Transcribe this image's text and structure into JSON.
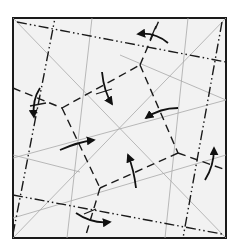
{
  "diagram": {
    "type": "origami crease pattern",
    "paper": {
      "x": 13,
      "y": 18,
      "width": 213,
      "height": 220,
      "fill": "#f2f2f2",
      "border": "#1a1a1a"
    },
    "colors": {
      "reference_line": "#a8a8a8",
      "crease": "#1a1a1a",
      "arrow": "#111111"
    },
    "reference_lines": [
      {
        "id": "diag-tl-br",
        "x1": 13,
        "y1": 18,
        "x2": 226,
        "y2": 238
      },
      {
        "id": "diag-bl-tr",
        "x1": 13,
        "y1": 238,
        "x2": 226,
        "y2": 18
      },
      {
        "id": "steep-left",
        "x1": 92,
        "y1": 18,
        "x2": 67,
        "y2": 238
      },
      {
        "id": "steep-right",
        "x1": 165,
        "y1": 238,
        "x2": 188,
        "y2": 18
      },
      {
        "id": "shallow-upper",
        "x1": 13,
        "y1": 158,
        "x2": 226,
        "y2": 100
      },
      {
        "id": "shallow-lower",
        "x1": 13,
        "y1": 218,
        "x2": 226,
        "y2": 155
      },
      {
        "id": "shallow-top",
        "x1": 120,
        "y1": 55,
        "x2": 226,
        "y2": 100
      },
      {
        "id": "shallow-left",
        "x1": 13,
        "y1": 155,
        "x2": 80,
        "y2": 172
      }
    ],
    "mountain_folds": [
      {
        "id": "top-chain",
        "x1": 17,
        "y1": 22,
        "x2": 226,
        "y2": 62
      },
      {
        "id": "left-chain",
        "x1": 13,
        "y1": 234,
        "x2": 55,
        "y2": 18
      },
      {
        "id": "right-chain",
        "x1": 222,
        "y1": 22,
        "x2": 183,
        "y2": 238
      },
      {
        "id": "bottom-chain",
        "x1": 13,
        "y1": 195,
        "x2": 222,
        "y2": 234
      }
    ],
    "valley_folds": [
      {
        "id": "v-left-upper",
        "x1": 13,
        "y1": 88,
        "x2": 62,
        "y2": 108
      },
      {
        "id": "v-top-mid",
        "x1": 62,
        "y1": 108,
        "x2": 140,
        "y2": 65
      },
      {
        "id": "v-top-right",
        "x1": 140,
        "y1": 65,
        "x2": 160,
        "y2": 18
      },
      {
        "id": "v-right-upper",
        "x1": 140,
        "y1": 65,
        "x2": 178,
        "y2": 153
      },
      {
        "id": "v-right-mid",
        "x1": 178,
        "y1": 153,
        "x2": 226,
        "y2": 170
      },
      {
        "id": "v-bottom-mid",
        "x1": 178,
        "y1": 153,
        "x2": 100,
        "y2": 188
      },
      {
        "id": "v-bottom",
        "x1": 100,
        "y1": 188,
        "x2": 85,
        "y2": 238
      },
      {
        "id": "v-left-lower",
        "x1": 62,
        "y1": 108,
        "x2": 100,
        "y2": 188
      }
    ],
    "arrows": [
      {
        "id": "arrow-top",
        "path": "M 168 43 Q 155 32 138 34",
        "head": [
          138,
          34
        ],
        "dir": "left"
      },
      {
        "id": "arrow-left-down",
        "path": "M 40 88 Q 32 100 34 117",
        "head": [
          34,
          117
        ],
        "dir": "down"
      },
      {
        "id": "arrow-center-down",
        "path": "M 102 72 Q 104 92 112 104",
        "head": [
          112,
          104
        ],
        "dir": "down"
      },
      {
        "id": "arrow-right-center",
        "path": "M 178 108 Q 160 108 146 118",
        "head": [
          146,
          118
        ],
        "dir": "left"
      },
      {
        "id": "arrow-center-right",
        "path": "M 60 150 Q 78 142 94 140",
        "head": [
          94,
          140
        ],
        "dir": "right"
      },
      {
        "id": "arrow-center-up",
        "path": "M 136 188 Q 134 170 128 155",
        "head": [
          128,
          155
        ],
        "dir": "up"
      },
      {
        "id": "arrow-right-up",
        "path": "M 205 180 Q 214 166 214 148",
        "head": [
          214,
          148
        ],
        "dir": "up"
      },
      {
        "id": "arrow-bottom",
        "path": "M 76 213 Q 92 224 110 222",
        "head": [
          110,
          222
        ],
        "dir": "right"
      }
    ],
    "tick_marks": [
      {
        "x1": 150,
        "y1": 40,
        "x2": 156,
        "y2": 26
      },
      {
        "x1": 30,
        "y1": 106,
        "x2": 46,
        "y2": 103
      },
      {
        "x1": 96,
        "y1": 94,
        "x2": 112,
        "y2": 89
      },
      {
        "x1": 84,
        "y1": 214,
        "x2": 96,
        "y2": 209
      }
    ]
  }
}
